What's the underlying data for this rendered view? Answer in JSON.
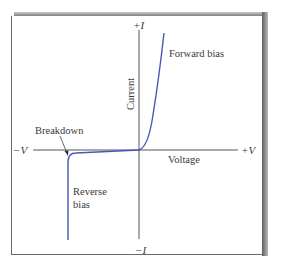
{
  "figure": {
    "type": "diode-iv-characteristic",
    "axes": {
      "y_positive": "+I",
      "y_negative": "−I",
      "x_positive": "+V",
      "x_negative": "−V",
      "y_title": "Current",
      "x_title": "Voltage"
    },
    "annotations": {
      "forward": "Forward bias",
      "breakdown": "Breakdown",
      "reverse_line1": "Reverse",
      "reverse_line2": "bias"
    },
    "colors": {
      "curve": "#4a55b8",
      "axis": "#555555",
      "text": "#3a3a3a"
    }
  }
}
